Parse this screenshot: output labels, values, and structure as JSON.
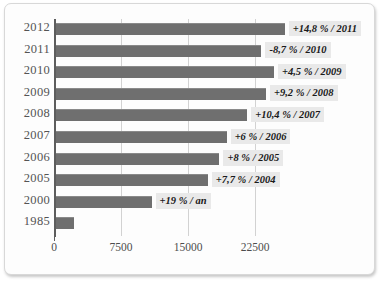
{
  "chart_data": {
    "type": "bar",
    "orientation": "horizontal",
    "title": "",
    "xlabel": "",
    "ylabel": "",
    "categories": [
      "2012",
      "2011",
      "2010",
      "2009",
      "2008",
      "2007",
      "2006",
      "2005",
      "2000",
      "1985"
    ],
    "values": [
      25600,
      23000,
      24400,
      23500,
      21400,
      19100,
      18300,
      17000,
      10700,
      2000
    ],
    "annotations": [
      "+14,8 % / 2011",
      "-8,7 % / 2010",
      "+4,5 % / 2009",
      "+9,2 % / 2008",
      "+10,4 % / 2007",
      "+6 % / 2006",
      "+8 % / 2005",
      "+7,7 % / 2004",
      "+19 % / an",
      ""
    ],
    "xticks": [
      "0",
      "7500",
      "15000",
      "22500"
    ],
    "xtick_values": [
      0,
      7500,
      15000,
      22500
    ],
    "xlim": [
      0,
      27000
    ],
    "grid": true,
    "legend": "none",
    "bar_color": "#6f6f6f",
    "label_background": "#e9e9e9",
    "axis_color": "#5d5d5d",
    "grid_color": "#d2d2d2"
  }
}
